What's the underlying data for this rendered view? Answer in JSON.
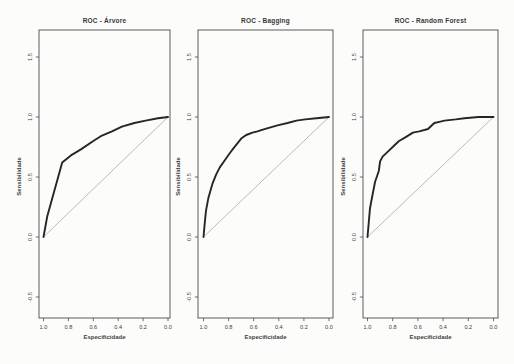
{
  "figure": {
    "background_color": "#fcfcfb",
    "axis_color": "#4d4d4d",
    "text_color": "#3d3d3d"
  },
  "chart_data": [
    {
      "type": "line",
      "title": "ROC - Árvore",
      "xlabel": "Especificidade",
      "ylabel": "Sensibilidade",
      "x_axis": {
        "ticks": [
          1.0,
          0.8,
          0.6,
          0.4,
          0.2,
          0.0
        ],
        "tick_labels": [
          "1.0",
          "0.8",
          "0.6",
          "0.4",
          "0.2",
          "0.0"
        ],
        "reversed": true
      },
      "y_axis": {
        "ticks": [
          -0.5,
          0.0,
          0.5,
          1.0,
          1.5
        ],
        "tick_labels": [
          "-0.5",
          "0.0",
          "0.5",
          "1.0",
          "1.5"
        ]
      },
      "grid": false,
      "series": [
        {
          "name": "roc-curve",
          "color": "#262626",
          "width": 1.9,
          "x": [
            1.0,
            0.97,
            0.85,
            0.78,
            0.7,
            0.6,
            0.54,
            0.45,
            0.37,
            0.27,
            0.18,
            0.08,
            0.0
          ],
          "y": [
            0.0,
            0.17,
            0.62,
            0.68,
            0.73,
            0.8,
            0.84,
            0.88,
            0.92,
            0.95,
            0.97,
            0.99,
            1.0
          ]
        },
        {
          "name": "chance-diagonal",
          "color": "#b3b3b3",
          "width": 0.9,
          "x": [
            1.0,
            0.0
          ],
          "y": [
            0.0,
            1.0
          ]
        }
      ]
    },
    {
      "type": "line",
      "title": "ROC - Bagging",
      "xlabel": "Especificidade",
      "ylabel": "Sensibilidade",
      "x_axis": {
        "ticks": [
          1.0,
          0.8,
          0.6,
          0.4,
          0.2,
          0.0
        ],
        "tick_labels": [
          "1.0",
          "0.8",
          "0.6",
          "0.4",
          "0.2",
          "0.0"
        ],
        "reversed": true
      },
      "y_axis": {
        "ticks": [
          -0.5,
          0.0,
          0.5,
          1.0,
          1.5
        ],
        "tick_labels": [
          "-0.5",
          "0.0",
          "0.5",
          "1.0",
          "1.5"
        ]
      },
      "grid": false,
      "series": [
        {
          "name": "roc-curve",
          "color": "#262626",
          "width": 1.9,
          "x": [
            1.0,
            0.99,
            0.98,
            0.96,
            0.93,
            0.9,
            0.87,
            0.83,
            0.79,
            0.76,
            0.73,
            0.7,
            0.66,
            0.61,
            0.57,
            0.54,
            0.48,
            0.41,
            0.33,
            0.26,
            0.19,
            0.1,
            0.0
          ],
          "y": [
            0.0,
            0.12,
            0.22,
            0.33,
            0.44,
            0.52,
            0.58,
            0.64,
            0.7,
            0.74,
            0.78,
            0.82,
            0.85,
            0.87,
            0.88,
            0.89,
            0.91,
            0.93,
            0.95,
            0.97,
            0.98,
            0.99,
            1.0
          ]
        },
        {
          "name": "chance-diagonal",
          "color": "#b3b3b3",
          "width": 0.9,
          "x": [
            1.0,
            0.0
          ],
          "y": [
            0.0,
            1.0
          ]
        }
      ]
    },
    {
      "type": "line",
      "title": "ROC - Random Forest",
      "xlabel": "Especificidade",
      "ylabel": "Sensibilidade",
      "x_axis": {
        "ticks": [
          1.0,
          0.8,
          0.6,
          0.4,
          0.2,
          0.0
        ],
        "tick_labels": [
          "1.0",
          "0.8",
          "0.6",
          "0.4",
          "0.2",
          "0.0"
        ],
        "reversed": true
      },
      "y_axis": {
        "ticks": [
          -0.5,
          0.0,
          0.5,
          1.0,
          1.5
        ],
        "tick_labels": [
          "-0.5",
          "0.0",
          "0.5",
          "1.0",
          "1.5"
        ]
      },
      "grid": false,
      "series": [
        {
          "name": "roc-curve",
          "color": "#262626",
          "width": 1.9,
          "x": [
            1.0,
            0.98,
            0.96,
            0.94,
            0.91,
            0.9,
            0.88,
            0.83,
            0.79,
            0.75,
            0.7,
            0.64,
            0.59,
            0.52,
            0.47,
            0.43,
            0.39,
            0.3,
            0.23,
            0.12,
            0.0
          ],
          "y": [
            0.0,
            0.24,
            0.35,
            0.46,
            0.55,
            0.63,
            0.67,
            0.72,
            0.76,
            0.8,
            0.83,
            0.87,
            0.88,
            0.9,
            0.95,
            0.96,
            0.97,
            0.98,
            0.99,
            1.0,
            1.0
          ]
        },
        {
          "name": "chance-diagonal",
          "color": "#b3b3b3",
          "width": 0.9,
          "x": [
            1.0,
            0.0
          ],
          "y": [
            0.0,
            1.0
          ]
        }
      ]
    }
  ]
}
